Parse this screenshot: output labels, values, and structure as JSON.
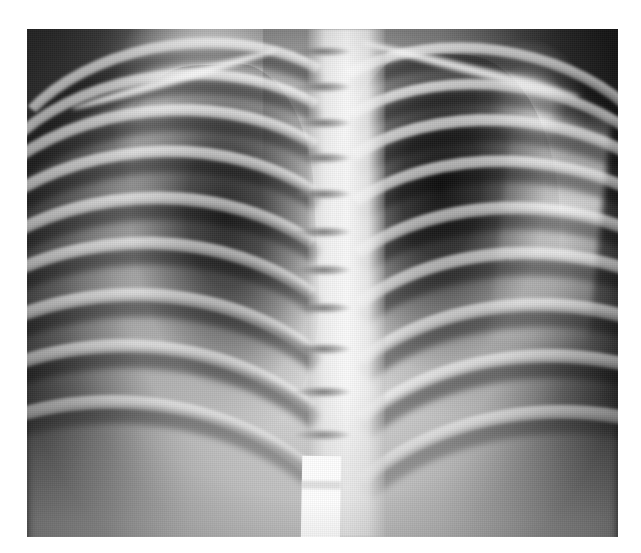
{
  "document": {
    "type": "medical-radiograph",
    "modality": "X-ray",
    "view": "AP (anteroposterior) chest",
    "subject": "pediatric thorax",
    "background_color": "#ffffff",
    "plate_bounds": {
      "left": 27,
      "top": 29,
      "width": 591,
      "height": 508
    },
    "image_size": {
      "width": 641,
      "height": 553
    }
  },
  "palette": {
    "paper_white": "#ffffff",
    "marker_white": "#fdfdfd",
    "bone_bright": "#f2f2f2",
    "soft_tissue_mid": "#b4b4b4",
    "lung_field_dark": "#1e1e1e",
    "background_dark": "#2e2e2e",
    "deep_black": "#0a0a0a"
  },
  "anatomy": {
    "regions": [
      {
        "name": "left-shoulder-scapula",
        "label": "Left shoulder / scapula",
        "tone": "bright"
      },
      {
        "name": "right-shoulder-humeral-head",
        "label": "Right humeral head",
        "tone": "bright"
      },
      {
        "name": "right-humerus-shaft",
        "label": "Right humerus",
        "tone": "bright"
      },
      {
        "name": "left-lung-field",
        "label": "Left lung field",
        "tone": "dark"
      },
      {
        "name": "right-lung-field",
        "label": "Right lung field",
        "tone": "very-dark"
      },
      {
        "name": "thoracic-spine",
        "label": "Thoracic spine",
        "tone": "bright"
      },
      {
        "name": "diaphragm",
        "label": "Diaphragm / upper abdomen",
        "tone": "mid"
      }
    ],
    "vertebrae": {
      "count": 10,
      "label": "Thoracic vertebral bodies",
      "gap_tops_pct": [
        3.5,
        10.5,
        17.5,
        24.5,
        31.5,
        39.0,
        46.5,
        54.0,
        62.0,
        70.5,
        79.0
      ]
    },
    "clavicles": [
      {
        "name": "clavicle-left",
        "left_pct": 7,
        "top_pct": 9,
        "width_pct": 36,
        "rotate_deg": -16
      },
      {
        "name": "clavicle-right",
        "left_pct": 56,
        "top_pct": 7,
        "width_pct": 38,
        "rotate_deg": 14
      }
    ],
    "ribs_left": [
      {
        "left_pct": -6,
        "top_pct": 2,
        "width_pct": 62,
        "height_pct": 46,
        "border_px": 11,
        "rotate_deg": -8
      },
      {
        "left_pct": -10,
        "top_pct": 8,
        "width_pct": 66,
        "height_pct": 50,
        "border_px": 11,
        "rotate_deg": -7
      },
      {
        "left_pct": -14,
        "top_pct": 15,
        "width_pct": 70,
        "height_pct": 54,
        "border_px": 12,
        "rotate_deg": -6
      },
      {
        "left_pct": -17,
        "top_pct": 23,
        "width_pct": 73,
        "height_pct": 58,
        "border_px": 12,
        "rotate_deg": -5
      },
      {
        "left_pct": -20,
        "top_pct": 32,
        "width_pct": 76,
        "height_pct": 62,
        "border_px": 13,
        "rotate_deg": -4
      },
      {
        "left_pct": -23,
        "top_pct": 41,
        "width_pct": 79,
        "height_pct": 66,
        "border_px": 13,
        "rotate_deg": -3
      },
      {
        "left_pct": -26,
        "top_pct": 51,
        "width_pct": 82,
        "height_pct": 70,
        "border_px": 14,
        "rotate_deg": -2
      },
      {
        "left_pct": -29,
        "top_pct": 61,
        "width_pct": 85,
        "height_pct": 74,
        "border_px": 14,
        "rotate_deg": -1
      },
      {
        "left_pct": -32,
        "top_pct": 72,
        "width_pct": 88,
        "height_pct": 78,
        "border_px": 14,
        "rotate_deg": 0
      }
    ],
    "ribs_right": [
      {
        "left_pct": 44,
        "top_pct": 3,
        "width_pct": 62,
        "height_pct": 46,
        "border_px": 11,
        "rotate_deg": 8
      },
      {
        "left_pct": 44,
        "top_pct": 10,
        "width_pct": 66,
        "height_pct": 50,
        "border_px": 11,
        "rotate_deg": 7
      },
      {
        "left_pct": 44,
        "top_pct": 17,
        "width_pct": 70,
        "height_pct": 54,
        "border_px": 12,
        "rotate_deg": 6
      },
      {
        "left_pct": 44,
        "top_pct": 25,
        "width_pct": 73,
        "height_pct": 58,
        "border_px": 12,
        "rotate_deg": 5
      },
      {
        "left_pct": 44,
        "top_pct": 34,
        "width_pct": 76,
        "height_pct": 62,
        "border_px": 13,
        "rotate_deg": 4
      },
      {
        "left_pct": 44,
        "top_pct": 43,
        "width_pct": 79,
        "height_pct": 66,
        "border_px": 13,
        "rotate_deg": 3
      },
      {
        "left_pct": 44,
        "top_pct": 53,
        "width_pct": 82,
        "height_pct": 70,
        "border_px": 14,
        "rotate_deg": 2
      },
      {
        "left_pct": 44,
        "top_pct": 63,
        "width_pct": 85,
        "height_pct": 74,
        "border_px": 14,
        "rotate_deg": 1
      },
      {
        "left_pct": 44,
        "top_pct": 74,
        "width_pct": 88,
        "height_pct": 78,
        "border_px": 14,
        "rotate_deg": 0
      }
    ]
  },
  "artifacts": {
    "marker": {
      "name": "radiopaque-marker",
      "label": "Bright white rectangular marker",
      "color": "#fdfdfd",
      "position_pct": {
        "left": 50.0,
        "top": 84.0,
        "width": 6.6,
        "height": 16.5
      }
    }
  },
  "overlays": {
    "grain": "film-grain-halftone",
    "vignette": "edge-darkening"
  }
}
